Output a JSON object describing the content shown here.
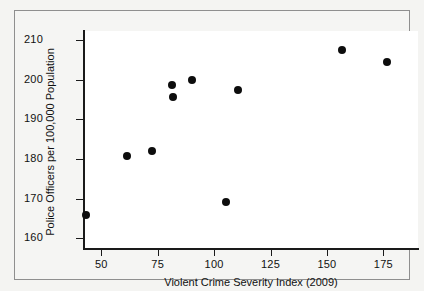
{
  "chart_data": {
    "type": "scatter",
    "title": "",
    "xlabel": "Violent Crime Severity Index (2009)",
    "ylabel": "Police Officers per 100,000 Population",
    "xlim": [
      37,
      184
    ],
    "ylim": [
      160,
      214
    ],
    "xticks": [
      50,
      75,
      100,
      125,
      150,
      175
    ],
    "yticks": [
      160,
      170,
      180,
      190,
      200,
      210
    ],
    "xtick_labels": [
      "50",
      "75",
      "100",
      "125",
      "150",
      "175"
    ],
    "ytick_labels": [
      "160",
      "170",
      "180",
      "190",
      "200",
      "210"
    ],
    "grid": false,
    "legend": null,
    "marker": "filled-circle",
    "marker_color": "#0d0d0d",
    "points": [
      {
        "x": 43.2,
        "y": 165.9
      },
      {
        "x": 61.3,
        "y": 180.7
      },
      {
        "x": 72.5,
        "y": 182.1
      },
      {
        "x": 81.2,
        "y": 198.6
      },
      {
        "x": 81.6,
        "y": 195.7
      },
      {
        "x": 90.1,
        "y": 200.0
      },
      {
        "x": 105.3,
        "y": 169.1
      },
      {
        "x": 110.7,
        "y": 197.4
      },
      {
        "x": 156.9,
        "y": 207.4
      },
      {
        "x": 176.5,
        "y": 204.5
      }
    ]
  },
  "colors": {
    "marker": "#0d0d0d",
    "axis": "#1a1a1a",
    "plot_background": "#ffffff",
    "figure_background": "#f5f5f3",
    "border": "#8f8f8f"
  }
}
